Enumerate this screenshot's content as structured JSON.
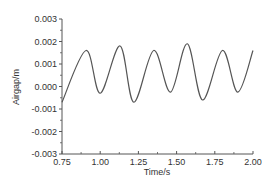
{
  "chart_data": {
    "type": "line",
    "title": "",
    "xlabel": "Time/s",
    "ylabel": "Airgap/m",
    "xlim": [
      0.75,
      2.0
    ],
    "ylim": [
      -0.003,
      0.003
    ],
    "x_ticks": [
      "0.75",
      "1.00",
      "1.25",
      "1.50",
      "1.75",
      "2.00"
    ],
    "y_ticks": [
      "0.003",
      "0.002",
      "0.001",
      "0.000",
      "-0.001",
      "-0.002",
      "-0.003"
    ],
    "grid": false,
    "legend": null,
    "series": [
      {
        "name": "Airgap",
        "color": "#555555",
        "x": [
          0.75,
          0.907,
          1.0,
          1.13,
          1.22,
          1.35,
          1.46,
          1.57,
          1.67,
          1.8,
          1.9,
          2.0
        ],
        "y": [
          -0.0007,
          0.0016,
          -0.0003,
          0.0018,
          -0.0007,
          0.0016,
          -0.00025,
          0.0019,
          -0.0006,
          0.0016,
          -0.00025,
          0.0016
        ]
      }
    ]
  }
}
